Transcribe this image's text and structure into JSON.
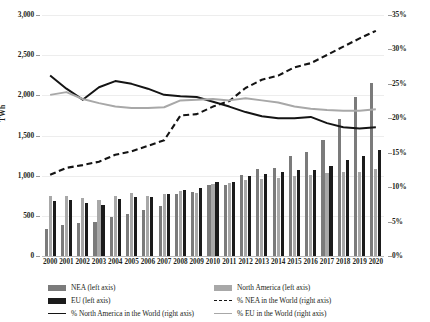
{
  "chart_data": {
    "type": "bar",
    "title": "",
    "subtitle": "",
    "xlabel": "",
    "ylabel": "TWh",
    "y2label": "",
    "categories": [
      "2000",
      "2001",
      "2002",
      "2003",
      "2004",
      "2005",
      "2006",
      "2007",
      "2008",
      "2009",
      "2010",
      "2011",
      "2012",
      "2013",
      "2014",
      "2015",
      "2016",
      "2017",
      "2018",
      "2019",
      "2020"
    ],
    "ylim": [
      0,
      3000
    ],
    "y2lim": [
      0,
      0.35
    ],
    "yticks": [
      "0",
      "500",
      "1,000",
      "1,500",
      "2,000",
      "2,500",
      "3,000"
    ],
    "y2ticks": [
      "0%",
      "5%",
      "10%",
      "15%",
      "20%",
      "25%",
      "30%",
      "35%"
    ],
    "grid": true,
    "legend_position": "below",
    "series": [
      {
        "name": "NEA (left axis)",
        "axis": "left",
        "kind": "bar",
        "color": "#7b7b7b",
        "values": [
          340,
          390,
          415,
          420,
          490,
          525,
          575,
          625,
          775,
          800,
          880,
          885,
          1010,
          1085,
          1090,
          1250,
          1300,
          1450,
          1700,
          1975,
          2150
        ]
      },
      {
        "name": "EU (left axis)",
        "axis": "left",
        "kind": "bar",
        "color": "#1b1b1b",
        "values": [
          690,
          700,
          660,
          635,
          705,
          730,
          740,
          775,
          825,
          850,
          920,
          920,
          1000,
          1020,
          1040,
          1065,
          1075,
          1125,
          1200,
          1240,
          1325
        ]
      },
      {
        "name": "North America (left axis)",
        "axis": "left",
        "kind": "bar",
        "color": "#a8a8a8",
        "values": [
          745,
          750,
          720,
          700,
          745,
          780,
          745,
          775,
          805,
          790,
          900,
          905,
          950,
          960,
          975,
          1000,
          1010,
          1030,
          1045,
          1050,
          1085
        ]
      },
      {
        "name": "% North America in the World (right axis)",
        "axis": "right",
        "kind": "line",
        "style": "solid",
        "color": "#141414",
        "values": [
          0.262,
          0.243,
          0.227,
          0.245,
          0.254,
          0.25,
          0.243,
          0.234,
          0.232,
          0.231,
          0.224,
          0.217,
          0.209,
          0.203,
          0.2,
          0.2,
          0.202,
          0.193,
          0.187,
          0.185,
          0.187
        ]
      },
      {
        "name": "% NEA in the World (right axis)",
        "axis": "right",
        "kind": "line",
        "style": "dashed",
        "color": "#141414",
        "values": [
          0.118,
          0.128,
          0.132,
          0.137,
          0.147,
          0.152,
          0.16,
          0.168,
          0.204,
          0.206,
          0.217,
          0.225,
          0.244,
          0.256,
          0.262,
          0.274,
          0.28,
          0.292,
          0.304,
          0.316,
          0.327
        ]
      },
      {
        "name": "% EU in the World (right axis)",
        "axis": "right",
        "kind": "line",
        "style": "solid",
        "color": "#a8a8a8",
        "values": [
          0.234,
          0.238,
          0.228,
          0.222,
          0.217,
          0.215,
          0.215,
          0.216,
          0.226,
          0.227,
          0.228,
          0.226,
          0.229,
          0.226,
          0.223,
          0.217,
          0.214,
          0.212,
          0.211,
          0.211,
          0.213
        ]
      }
    ]
  },
  "legend": {
    "left_column": [
      {
        "label": "NEA (left axis)",
        "swatch": "nea"
      },
      {
        "label": "EU (left axis)",
        "swatch": "eu"
      },
      {
        "label": "% North America in the World (right axis)",
        "swatch": "line-na"
      }
    ],
    "right_column": [
      {
        "label": "North America (left axis)",
        "swatch": "na"
      },
      {
        "label": "% NEA in the World (right axis)",
        "swatch": "line-nea"
      },
      {
        "label": "% EU in the World (right axis)",
        "swatch": "line-eu"
      }
    ]
  }
}
